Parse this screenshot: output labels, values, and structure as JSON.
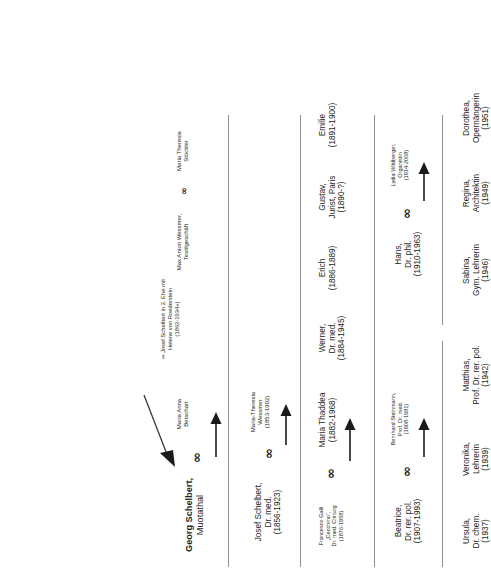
{
  "document": {
    "title": "Schelbert Familienstammbaum",
    "symbols": {
      "marriage": "∞",
      "arrow": "→"
    },
    "colors": {
      "text": "#231f20",
      "rule": "#8d9093",
      "arrow": "#1b1b1b"
    }
  },
  "generations": [
    {
      "id": "gen-1",
      "couples": [
        {
          "id": "couple-georg-maria",
          "husband": {
            "name": "Georg Schelbert,",
            "role": "Muotathal",
            "dates": ""
          },
          "wife": {
            "name": "Maria Anna",
            "role": "Betschart",
            "dates": ""
          }
        },
        {
          "id": "couple-max-maria",
          "husband": {
            "name": "Max Anton Wessmer,",
            "role": "Textilgeschäft",
            "dates": ""
          },
          "wife": {
            "name": "Maria Theresia",
            "role": "Stöckler",
            "dates": ""
          }
        }
      ]
    },
    {
      "id": "gen-2",
      "couples": [
        {
          "id": "couple-josef-mariatheresia",
          "husband": {
            "name": "Josef Schelbert,",
            "role": "Dr. med.",
            "dates": "(1856-1923)"
          },
          "wife": {
            "name": "Maria-Theresia",
            "role": "Wessmer",
            "dates": "(1853-1902)"
          }
        }
      ],
      "note": {
        "id": "note-second-marriage",
        "line1": "∞ Josef Schelbert in 2. Ehe mit",
        "line2": "Helene von Roederstein",
        "line3": "(1862-1934+)"
      }
    },
    {
      "id": "gen-3",
      "couples": [
        {
          "id": "couple-francesco-mariathaddea",
          "husband": {
            "name": "Francesco Galli",
            "role": "„Cecchino“,",
            "role2": "Dr. med. Chirurg",
            "dates": "(1876-1958)"
          },
          "wife": {
            "name": "Maria Thaddea",
            "role": "",
            "dates": "(1882-1968)"
          }
        }
      ],
      "siblings": [
        {
          "id": "node-werner",
          "name": "Werner,",
          "role": "Dr. med.",
          "dates": "(1884-1945)"
        },
        {
          "id": "node-erich",
          "name": "Erich",
          "role": "",
          "dates": "(1886-1889)"
        },
        {
          "id": "node-gustav",
          "name": "Gustav,",
          "role": "Jurist, Paris",
          "dates": "(1890-?)"
        },
        {
          "id": "node-emilie",
          "name": "Emilie",
          "role": "",
          "dates": "(1891-1900)"
        }
      ]
    },
    {
      "id": "gen-4",
      "couples": [
        {
          "id": "couple-bernhard-beatrice",
          "husband": {
            "name": "Bernhard Steinmann,",
            "role": "Prof. Dr. med.",
            "dates": "(1908-1981)"
          },
          "wife": {
            "name": "Beatrice,",
            "role": "Dr. rer. pol.",
            "dates": "(1907-1993)"
          }
        },
        {
          "id": "couple-hans-lydia",
          "husband": {
            "name": "Hans,",
            "role": "Dr. phil.",
            "dates": "(1910-1963)"
          },
          "wife": {
            "name": "Lydia Wildberger,",
            "role": "Organistin",
            "dates": "(1914-2008)"
          }
        }
      ]
    },
    {
      "id": "gen-5",
      "siblings_left": [
        {
          "id": "node-ursula",
          "name": "Ursula,",
          "role": "Dr. chem.",
          "dates": "(1937)"
        },
        {
          "id": "node-veronika",
          "name": "Veronika,",
          "role": "Lehrerin",
          "dates": "(1939)"
        },
        {
          "id": "node-matthias",
          "name": "Matthias,",
          "role": "Prof. Dr. rer. pol.",
          "dates": "(1942)"
        }
      ],
      "siblings_right": [
        {
          "id": "node-sabina",
          "name": "Sabina,",
          "role": "Gym. Lehrerin",
          "dates": "(1946)"
        },
        {
          "id": "node-regina",
          "name": "Regina,",
          "role": "Architektin",
          "dates": "(1949)"
        },
        {
          "id": "node-dorothea",
          "name": "Dorothea,",
          "role": "Opernängerin",
          "dates": "(1951)"
        }
      ]
    }
  ]
}
